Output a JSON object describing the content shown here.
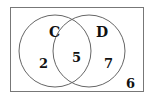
{
  "diagram": {
    "type": "venn",
    "sets": [
      {
        "name": "C",
        "only_count": "2"
      },
      {
        "name": "D",
        "only_count": "7"
      }
    ],
    "intersection_count": "5",
    "outside_count": "6",
    "colors": {
      "stroke": "#666666",
      "text": "#111111",
      "background": "#ffffff"
    }
  }
}
